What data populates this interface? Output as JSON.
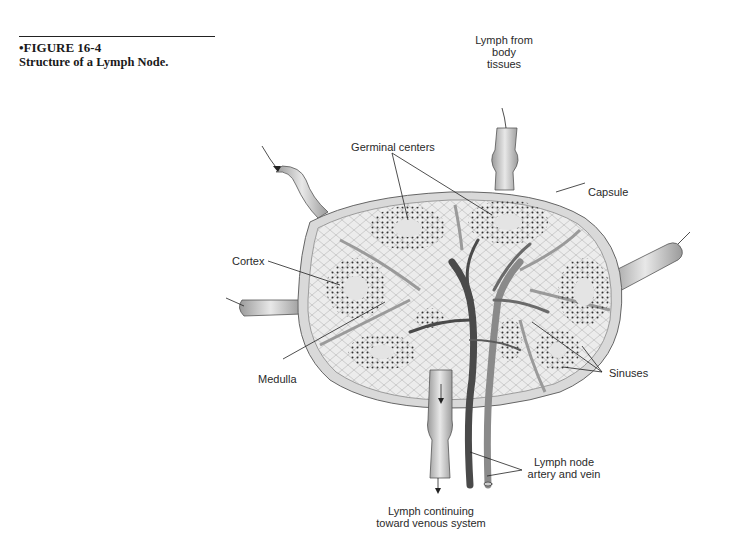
{
  "caption": {
    "figure_number": "•FIGURE 16-4",
    "title": "Structure of a Lymph Node."
  },
  "diagram": {
    "labels": {
      "lymph_from_tissues": "Lymph from\nbody\ntissues",
      "germinal_centers": "Germinal centers",
      "capsule": "Capsule",
      "cortex": "Cortex",
      "medulla": "Medulla",
      "sinuses": "Sinuses",
      "artery_vein": "Lymph node\nartery and vein",
      "lymph_continuing": "Lymph continuing\ntoward venous system"
    },
    "colors": {
      "capsule": "#d9d9d9",
      "tissue": "#ececec",
      "follicle_dots": "#333333",
      "vessel_dark": "#4a4a4a",
      "vessel_light": "#8a8a8a",
      "leader_line": "#222222"
    }
  }
}
